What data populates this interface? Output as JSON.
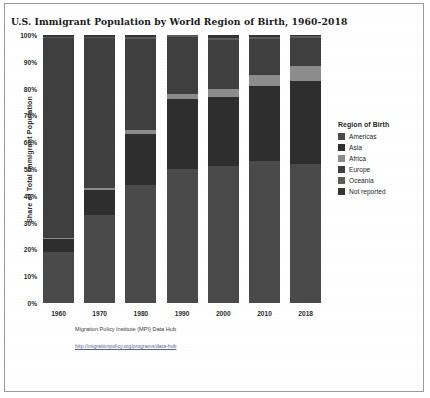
{
  "chart_title": "U.S. Immigrant Population by World Region of Birth, 1960-2018",
  "axes": {
    "ylabel": "Share of Total Immigrant Population",
    "yticks": [
      "100%",
      "90%",
      "80%",
      "70%",
      "60%",
      "50%",
      "40%",
      "30%",
      "20%",
      "10%",
      "0%"
    ]
  },
  "legend": {
    "title": "Region of Birth",
    "items": [
      {
        "label": "Americas",
        "color": "#4a4a4a"
      },
      {
        "label": "Asia",
        "color": "#2e2e2e"
      },
      {
        "label": "Africa",
        "color": "#8c8c8c"
      },
      {
        "label": "Europe",
        "color": "#3f3f3f"
      },
      {
        "label": "Oceania",
        "color": "#5c5c5c"
      },
      {
        "label": "Not reported",
        "color": "#353535"
      }
    ]
  },
  "source": {
    "line1": "Migration Policy Institute (MPI) Data Hub",
    "link": "http://migrationpolicy.org/programs/data-hub"
  },
  "chart_data": {
    "type": "bar",
    "stacked": true,
    "normalized": true,
    "title": "U.S. Immigrant Population by World Region of Birth, 1960-2018",
    "xlabel": "",
    "ylabel": "Share of Total Immigrant Population",
    "ylim": [
      0,
      100
    ],
    "grid": false,
    "legend_position": "right",
    "categories": [
      "1960",
      "1970",
      "1980",
      "1990",
      "2000",
      "2010",
      "2018"
    ],
    "series": [
      {
        "name": "Americas",
        "color": "#4a4a4a",
        "values": [
          19.0,
          33.0,
          44.0,
          50.0,
          51.0,
          53.0,
          52.0
        ]
      },
      {
        "name": "Asia",
        "color": "#2e2e2e",
        "values": [
          5.0,
          9.0,
          19.0,
          26.0,
          26.0,
          28.0,
          31.0
        ]
      },
      {
        "name": "Africa",
        "color": "#8c8c8c",
        "values": [
          0.4,
          0.8,
          1.5,
          1.8,
          2.8,
          4.0,
          5.5
        ]
      },
      {
        "name": "Europe",
        "color": "#3f3f3f",
        "values": [
          74.5,
          56.0,
          34.0,
          21.5,
          18.5,
          13.5,
          10.5
        ]
      },
      {
        "name": "Oceania",
        "color": "#5c5c5c",
        "values": [
          0.4,
          0.6,
          0.7,
          0.6,
          0.6,
          0.6,
          0.6
        ]
      },
      {
        "name": "Not reported",
        "color": "#353535",
        "values": [
          0.7,
          0.6,
          0.8,
          0.1,
          1.1,
          0.9,
          0.4
        ]
      }
    ]
  }
}
